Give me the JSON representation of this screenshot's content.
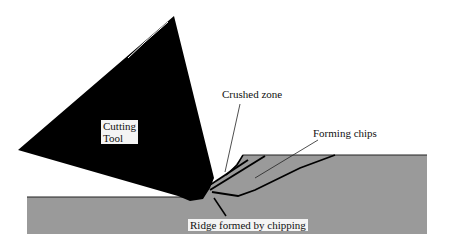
{
  "diagram": {
    "type": "machining-cross-section",
    "labels": {
      "tool_line1": "Cutting",
      "tool_line2": "Tool",
      "crushed_zone": "Crushed zone",
      "forming_chips": "Forming chips",
      "ridge": "Ridge formed by chipping"
    },
    "colors": {
      "tool": "#000000",
      "workpiece": "#9a9a9a",
      "background": "#ffffff",
      "label_box": "#f4f4f4"
    }
  }
}
